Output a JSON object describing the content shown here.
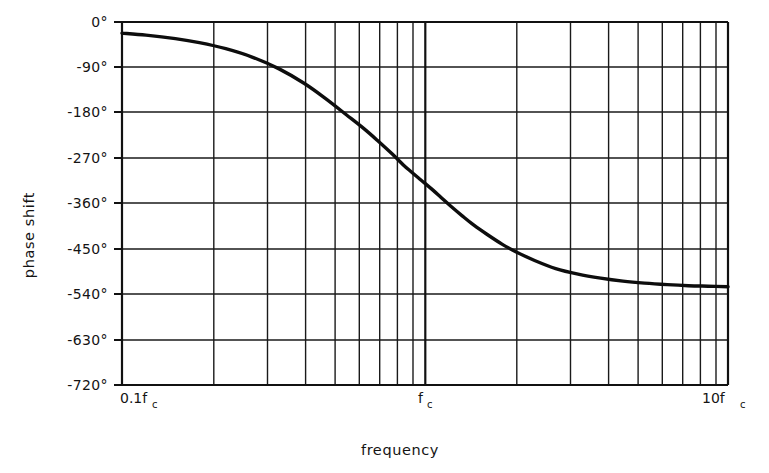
{
  "chart_data": {
    "type": "line",
    "title": "",
    "xlabel": "frequency",
    "ylabel": "phase shift",
    "xscale": "log",
    "yscale": "linear",
    "xlim": [
      0.1,
      10
    ],
    "ylim": [
      -720,
      0
    ],
    "grid": true,
    "legend": null,
    "x_tick_labels": [
      {
        "value": 0.1,
        "main": "0.1f",
        "sub": "c"
      },
      {
        "value": 1.0,
        "main": "f",
        "sub": "c"
      },
      {
        "value": 10.0,
        "main": "10f",
        "sub": "c"
      }
    ],
    "y_tick_labels": [
      "0°",
      "-90°",
      "-180°",
      "-270°",
      "-360°",
      "-450°",
      "-540°",
      "-630°",
      "-720°"
    ],
    "y_tick_values": [
      0,
      -90,
      -180,
      -270,
      -360,
      -450,
      -540,
      -630,
      -720
    ],
    "x_major_gridlines": [
      0.1,
      1.0,
      10.0
    ],
    "x_minor_gridlines": [
      0.2,
      0.3,
      0.4,
      0.5,
      0.6,
      0.7,
      0.8,
      0.9,
      2,
      3,
      4,
      5,
      6,
      7,
      8,
      9
    ],
    "series": [
      {
        "name": "phase shift",
        "x": [
          0.1,
          0.12,
          0.15,
          0.18,
          0.22,
          0.27,
          0.33,
          0.4,
          0.47,
          0.55,
          0.63,
          0.7,
          0.78,
          0.85,
          0.9,
          0.95,
          1.0,
          1.06,
          1.13,
          1.22,
          1.33,
          1.45,
          1.6,
          1.8,
          2.0,
          2.3,
          2.7,
          3.2,
          3.8,
          4.5,
          5.3,
          6.3,
          7.4,
          8.6,
          10.0
        ],
        "y": [
          -22,
          -26,
          -33,
          -41,
          -53,
          -70,
          -93,
          -122,
          -152,
          -184,
          -212,
          -236,
          -262,
          -284,
          -297,
          -309,
          -320,
          -333,
          -348,
          -366,
          -385,
          -403,
          -421,
          -441,
          -456,
          -473,
          -489,
          -500,
          -508,
          -514,
          -518,
          -521,
          -523,
          -524,
          -525
        ]
      }
    ],
    "annotations": []
  },
  "axis": {
    "y_title": "phase shift",
    "x_title": "frequency"
  }
}
